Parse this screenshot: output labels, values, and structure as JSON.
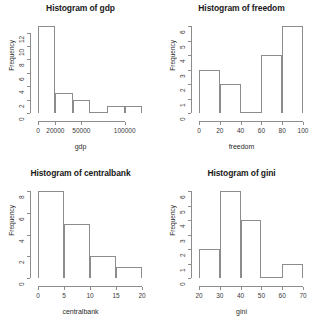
{
  "figure": {
    "layout": "2x2 grid of histograms",
    "background_color": "#ffffff",
    "line_color": "#8c8c8c",
    "text_color": "#1a1a1a"
  },
  "chart_data": [
    {
      "type": "bar",
      "title": "Histogram of gdp",
      "xlabel": "gdp",
      "ylabel": "Frequency",
      "grid": false,
      "legend": "none",
      "bin_edges": [
        0,
        20000,
        40000,
        60000,
        80000,
        100000,
        120000
      ],
      "categories": [
        "0-20000",
        "20000-40000",
        "40000-60000",
        "60000-80000",
        "80000-100000",
        "100000-120000"
      ],
      "values": [
        13,
        3,
        2,
        0,
        1,
        1
      ],
      "xticks": [
        0,
        20000,
        50000,
        100000
      ],
      "xtick_labels": [
        "0",
        "20000",
        "50000",
        "100000"
      ],
      "xlim": [
        0,
        120000
      ],
      "yticks": [
        0,
        2,
        4,
        6,
        8,
        10,
        12
      ],
      "ytick_labels": [
        "0",
        "2",
        "4",
        "6",
        "8",
        "10",
        "12"
      ],
      "ylim": [
        0,
        13
      ]
    },
    {
      "type": "bar",
      "title": "Histogram of freedom",
      "xlabel": "freedom",
      "ylabel": "Frequency",
      "grid": false,
      "legend": "none",
      "bin_edges": [
        0,
        20,
        40,
        60,
        80,
        100
      ],
      "categories": [
        "0-20",
        "20-40",
        "40-60",
        "60-80",
        "80-100"
      ],
      "values": [
        3,
        2,
        0,
        4,
        6
      ],
      "xticks": [
        0,
        20,
        40,
        60,
        80,
        100
      ],
      "xtick_labels": [
        "0",
        "20",
        "40",
        "60",
        "80",
        "100"
      ],
      "xlim": [
        0,
        100
      ],
      "yticks": [
        0,
        1,
        2,
        3,
        4,
        5,
        6
      ],
      "ytick_labels": [
        "0",
        "1",
        "2",
        "3",
        "4",
        "5",
        "6"
      ],
      "ylim": [
        0,
        6
      ]
    },
    {
      "type": "bar",
      "title": "Histogram of centralbank",
      "xlabel": "centralbank",
      "ylabel": "Frequency",
      "grid": false,
      "legend": "none",
      "bin_edges": [
        0,
        5,
        10,
        15,
        20
      ],
      "categories": [
        "0-5",
        "5-10",
        "10-15",
        "15-20"
      ],
      "values": [
        8,
        5,
        2,
        1
      ],
      "xticks": [
        0,
        5,
        10,
        15,
        20
      ],
      "xtick_labels": [
        "0",
        "5",
        "10",
        "15",
        "20"
      ],
      "xlim": [
        0,
        20
      ],
      "yticks": [
        0,
        2,
        4,
        6,
        8
      ],
      "ytick_labels": [
        "0",
        "2",
        "4",
        "6",
        "8"
      ],
      "ylim": [
        0,
        8
      ]
    },
    {
      "type": "bar",
      "title": "Histogram of gini",
      "xlabel": "gini",
      "ylabel": "Frequency",
      "grid": false,
      "legend": "none",
      "bin_edges": [
        20,
        30,
        40,
        50,
        60,
        70
      ],
      "categories": [
        "20-30",
        "30-40",
        "40-50",
        "50-60",
        "60-70"
      ],
      "values": [
        2,
        6,
        4,
        0,
        1
      ],
      "xticks": [
        20,
        30,
        40,
        50,
        60,
        70
      ],
      "xtick_labels": [
        "20",
        "30",
        "40",
        "50",
        "60",
        "70"
      ],
      "xlim": [
        20,
        70
      ],
      "yticks": [
        0,
        1,
        2,
        3,
        4,
        5,
        6
      ],
      "ytick_labels": [
        "0",
        "1",
        "2",
        "3",
        "4",
        "5",
        "6"
      ],
      "ylim": [
        0,
        6
      ]
    }
  ]
}
